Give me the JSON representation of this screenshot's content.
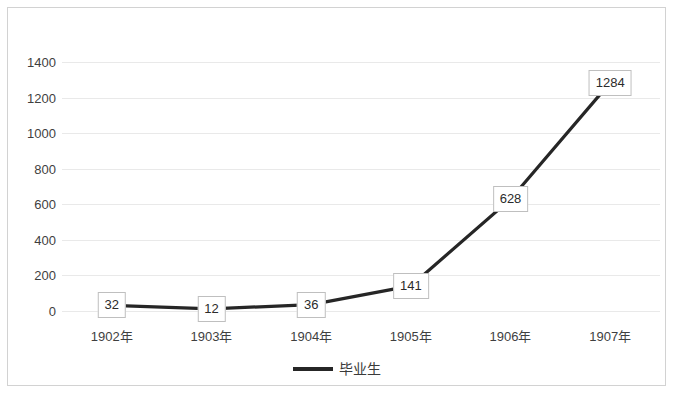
{
  "chart_data": {
    "type": "line",
    "title": "",
    "xlabel": "",
    "ylabel": "",
    "categories": [
      "1902年",
      "1903年",
      "1904年",
      "1905年",
      "1906年",
      "1907年"
    ],
    "series": [
      {
        "name": "毕业生",
        "values": [
          32,
          12,
          36,
          141,
          628,
          1284
        ],
        "color": "#262626"
      }
    ],
    "values": [
      32,
      12,
      36,
      141,
      628,
      1284
    ],
    "data_labels": [
      "32",
      "12",
      "36",
      "141",
      "628",
      "1284"
    ],
    "ylim": [
      0,
      1400
    ],
    "yticks": [
      0,
      200,
      400,
      600,
      800,
      1000,
      1200,
      1400
    ],
    "ytick_labels": [
      "0",
      "200",
      "400",
      "600",
      "800",
      "1000",
      "1200",
      "1400"
    ],
    "grid": true,
    "grid_axis": "y",
    "legend": {
      "position": "bottom",
      "entries": [
        "毕业生"
      ]
    },
    "colors": {
      "line": "#262626",
      "gridline": "#e9e9e9",
      "border": "#d2d2d2",
      "text": "#3f3f3f",
      "label_box_border": "#bfbfbf",
      "background": "#ffffff"
    }
  }
}
